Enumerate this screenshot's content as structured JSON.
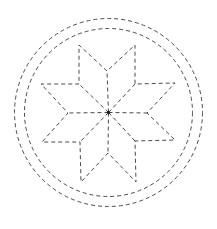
{
  "diagram": {
    "title": "",
    "stroke_color": "#4a4a4a",
    "background": "#ffffff",
    "center": {
      "x": 108.5,
      "y": 112.5
    },
    "circles": [
      {
        "name": "outer-circle",
        "r": 94
      },
      {
        "name": "inner-circle",
        "r": 84
      }
    ],
    "star_outline": [
      [
        107,
        71
      ],
      [
        79,
        45
      ],
      [
        79,
        84
      ],
      [
        41,
        84
      ],
      [
        68,
        113
      ],
      [
        42,
        142
      ],
      [
        80,
        142
      ],
      [
        81,
        182
      ],
      [
        108,
        153
      ],
      [
        136,
        182
      ],
      [
        135,
        141
      ],
      [
        175,
        140
      ],
      [
        147,
        113
      ],
      [
        175,
        83
      ],
      [
        135,
        84
      ],
      [
        135,
        45
      ]
    ],
    "rays": [
      [
        107,
        71
      ],
      [
        79,
        84
      ],
      [
        68,
        113
      ],
      [
        80,
        142
      ],
      [
        108,
        153
      ],
      [
        135,
        141
      ],
      [
        147,
        113
      ],
      [
        135,
        84
      ]
    ]
  }
}
